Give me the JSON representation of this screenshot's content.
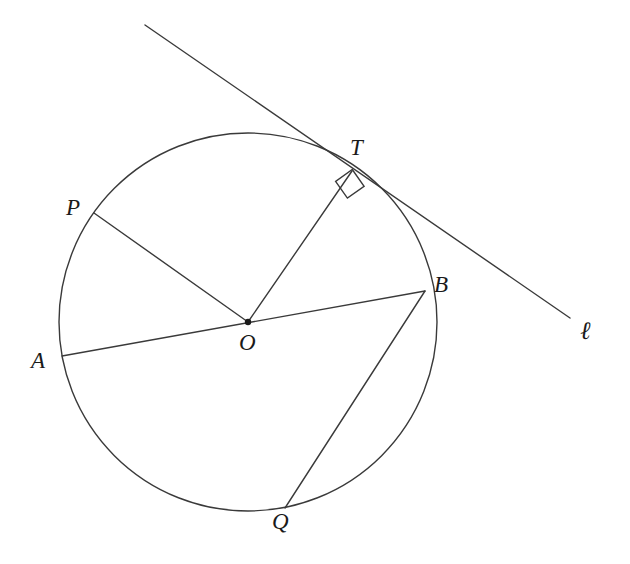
{
  "figure": {
    "background_color": "#ffffff",
    "stroke_color": "#3a3a3a",
    "label_color": "#1a1a1a",
    "stroke_width": 1.4
  },
  "circle": {
    "name": "circle-O",
    "center": {
      "x": 248,
      "y": 322
    },
    "radius": 189
  },
  "points": {
    "O": {
      "label": "O",
      "x": 248,
      "y": 322,
      "label_x": 239,
      "label_y": 331,
      "marked": true
    },
    "P": {
      "label": "P",
      "x": 94,
      "y": 213,
      "label_x": 66,
      "label_y": 196,
      "marked": false
    },
    "A": {
      "label": "A",
      "x": 62,
      "y": 356,
      "label_x": 31,
      "label_y": 349,
      "marked": false
    },
    "B": {
      "label": "B",
      "x": 425,
      "y": 291,
      "label_x": 434,
      "label_y": 273,
      "marked": false
    },
    "T": {
      "label": "T",
      "x": 352,
      "y": 171,
      "label_x": 350,
      "label_y": 136,
      "marked": false
    },
    "Q": {
      "label": "Q",
      "x": 285,
      "y": 508,
      "label_x": 272,
      "label_y": 510,
      "marked": false
    }
  },
  "segments": [
    {
      "name": "radius-OP",
      "from": "O",
      "to": "P",
      "x1": 248,
      "y1": 322,
      "x2": 94,
      "y2": 213
    },
    {
      "name": "diameter-AB",
      "from": "A",
      "to": "B",
      "x1": 62,
      "y1": 356,
      "x2": 425,
      "y2": 291
    },
    {
      "name": "radius-OT",
      "from": "O",
      "to": "T",
      "x1": 248,
      "y1": 322,
      "x2": 352,
      "y2": 171
    },
    {
      "name": "chord-BQ",
      "from": "B",
      "to": "Q",
      "x1": 425,
      "y1": 291,
      "x2": 285,
      "y2": 508
    }
  ],
  "tangent_line": {
    "name": "tangent-line-ell",
    "label": "ℓ",
    "label_x": 580,
    "label_y": 318,
    "x1": 145,
    "y1": 25,
    "x2": 570,
    "y2": 318,
    "touch_point": "T"
  },
  "right_angle_marker": {
    "name": "right-angle-marker-at-T",
    "size": 22,
    "points": "335.6,181.4 347.4,198.1 364.1,186.3 352.3,169.5"
  }
}
